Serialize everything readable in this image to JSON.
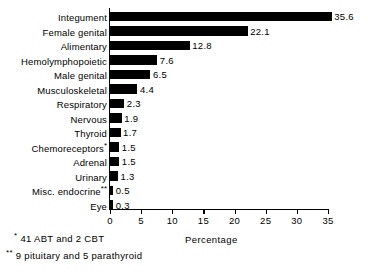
{
  "chart_data": {
    "type": "bar",
    "orientation": "horizontal",
    "title": "",
    "subtitle": "",
    "xlabel": "Percentage",
    "ylabel": "",
    "xlim": [
      0,
      35
    ],
    "xticks": [
      0,
      5,
      10,
      15,
      20,
      25,
      30,
      35
    ],
    "xtick_labels": [
      "0",
      "5",
      "10",
      "15",
      "20",
      "25",
      "30",
      "35"
    ],
    "grid": false,
    "legend": null,
    "bar_color": "#000000",
    "background_color": "#ffffff",
    "categories": [
      "Integument",
      "Female genital",
      "Alimentary",
      "Hemolymphopoietic",
      "Male genital",
      "Musculoskeletal",
      "Respiratory",
      "Nervous",
      "Thyroid",
      "Chemoreceptors",
      "Adrenal",
      "Urinary",
      "Misc. endocrine",
      "Eye"
    ],
    "values": [
      35.6,
      22.1,
      12.8,
      7.6,
      6.5,
      4.4,
      2.3,
      1.9,
      1.7,
      1.5,
      1.5,
      1.3,
      0.5,
      0.3
    ],
    "value_labels": [
      "35.6",
      "22.1",
      "12.8",
      "7.6",
      "6.5",
      "4.4",
      "2.3",
      "1.9",
      "1.7",
      "1.5",
      "1.5",
      "1.3",
      "0.5",
      "0.3"
    ],
    "category_footnote_marks": [
      "",
      "",
      "",
      "",
      "",
      "",
      "",
      "",
      "",
      "*",
      "",
      "",
      "**",
      ""
    ],
    "annotations": [
      {
        "mark": "*",
        "text": "41 ABT and 2 CBT"
      },
      {
        "mark": "**",
        "text": "9 pituitary and 5 parathyroid"
      }
    ]
  },
  "footnotes": {
    "one": {
      "mark": "*",
      "text": "41 ABT and 2 CBT"
    },
    "two": {
      "mark": "**",
      "text": "9 pituitary and 5 parathyroid"
    }
  }
}
